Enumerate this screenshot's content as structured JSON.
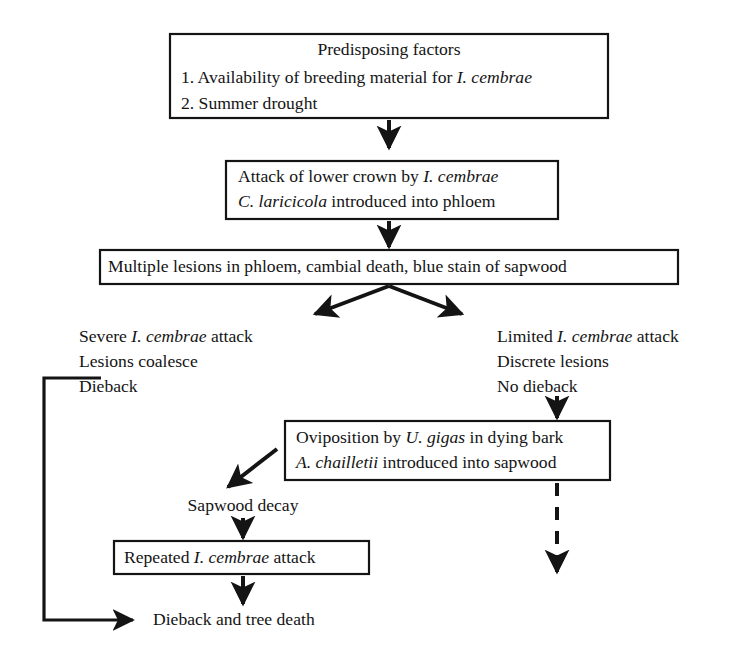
{
  "diagram": {
    "type": "flowchart",
    "colors": {
      "background": "#ffffff",
      "stroke": "#141414",
      "text": "#141414"
    },
    "nodes": [
      {
        "id": "predisposing-factors",
        "shape": "box",
        "lines": [
          {
            "segments": [
              {
                "text": "Predisposing factors",
                "italic": false
              }
            ],
            "align": "center"
          },
          {
            "segments": [
              {
                "text": "1. Availability of breeding material for ",
                "italic": false
              },
              {
                "text": "I. cembrae",
                "italic": true
              }
            ],
            "align": "left"
          },
          {
            "segments": [
              {
                "text": "2. Summer drought",
                "italic": false
              }
            ],
            "align": "left"
          }
        ]
      },
      {
        "id": "attack-lower-crown",
        "shape": "box",
        "lines": [
          {
            "segments": [
              {
                "text": "Attack of lower crown by ",
                "italic": false
              },
              {
                "text": "I. cembrae",
                "italic": true
              }
            ],
            "align": "left"
          },
          {
            "segments": [
              {
                "text": "C. laricicola",
                "italic": true
              },
              {
                "text": " introduced into phloem",
                "italic": false
              }
            ],
            "align": "left"
          }
        ]
      },
      {
        "id": "multiple-lesions",
        "shape": "box",
        "lines": [
          {
            "segments": [
              {
                "text": "Multiple lesions in phloem, cambial death, blue stain of sapwood",
                "italic": false
              }
            ],
            "align": "left"
          }
        ]
      },
      {
        "id": "severe-attack",
        "shape": "plain",
        "lines": [
          {
            "segments": [
              {
                "text": "Severe ",
                "italic": false
              },
              {
                "text": "I. cembrae",
                "italic": true
              },
              {
                "text": " attack",
                "italic": false
              }
            ],
            "align": "left"
          },
          {
            "segments": [
              {
                "text": "Lesions coalesce",
                "italic": false
              }
            ],
            "align": "left"
          },
          {
            "segments": [
              {
                "text": "Dieback",
                "italic": false
              }
            ],
            "align": "left"
          }
        ]
      },
      {
        "id": "limited-attack",
        "shape": "plain",
        "lines": [
          {
            "segments": [
              {
                "text": "Limited ",
                "italic": false
              },
              {
                "text": "I. cembrae",
                "italic": true
              },
              {
                "text": " attack",
                "italic": false
              }
            ],
            "align": "left"
          },
          {
            "segments": [
              {
                "text": "Discrete lesions",
                "italic": false
              }
            ],
            "align": "left"
          },
          {
            "segments": [
              {
                "text": "No dieback",
                "italic": false
              }
            ],
            "align": "left"
          }
        ]
      },
      {
        "id": "oviposition",
        "shape": "box",
        "lines": [
          {
            "segments": [
              {
                "text": "Oviposition by ",
                "italic": false
              },
              {
                "text": "U. gigas",
                "italic": true
              },
              {
                "text": " in dying bark",
                "italic": false
              }
            ],
            "align": "left"
          },
          {
            "segments": [
              {
                "text": "A. chailletii",
                "italic": true
              },
              {
                "text": " introduced into sapwood",
                "italic": false
              }
            ],
            "align": "left"
          }
        ]
      },
      {
        "id": "sapwood-decay",
        "shape": "plain",
        "lines": [
          {
            "segments": [
              {
                "text": "Sapwood decay",
                "italic": false
              }
            ],
            "align": "center"
          }
        ]
      },
      {
        "id": "repeated-attack",
        "shape": "box",
        "lines": [
          {
            "segments": [
              {
                "text": "Repeated ",
                "italic": false
              },
              {
                "text": "I. cembrae",
                "italic": true
              },
              {
                "text": " attack",
                "italic": false
              }
            ],
            "align": "left"
          }
        ]
      },
      {
        "id": "dieback-tree-death",
        "shape": "plain",
        "lines": [
          {
            "segments": [
              {
                "text": "Dieback and tree death",
                "italic": false
              }
            ],
            "align": "left"
          }
        ]
      }
    ],
    "edges": [
      {
        "id": "edge-factors-to-attack",
        "from": "predisposing-factors",
        "to": "attack-lower-crown",
        "style": "solid",
        "arrow": true
      },
      {
        "id": "edge-attack-to-lesions",
        "from": "attack-lower-crown",
        "to": "multiple-lesions",
        "style": "solid",
        "arrow": true
      },
      {
        "id": "edge-lesions-to-severe",
        "from": "multiple-lesions",
        "to": "severe-attack",
        "style": "solid",
        "arrow": true
      },
      {
        "id": "edge-lesions-to-limited",
        "from": "multiple-lesions",
        "to": "limited-attack",
        "style": "solid",
        "arrow": true
      },
      {
        "id": "edge-limited-to-oviposition",
        "from": "limited-attack",
        "to": "oviposition",
        "style": "solid",
        "arrow": true
      },
      {
        "id": "edge-oviposition-to-sapwood-decay",
        "from": "oviposition",
        "to": "sapwood-decay",
        "style": "solid",
        "arrow": true
      },
      {
        "id": "edge-sapwood-decay-to-repeated",
        "from": "sapwood-decay",
        "to": "repeated-attack",
        "style": "solid",
        "arrow": true
      },
      {
        "id": "edge-repeated-to-dieback",
        "from": "repeated-attack",
        "to": "dieback-tree-death",
        "style": "solid",
        "arrow": true
      },
      {
        "id": "edge-severe-to-dieback-loop",
        "from": "severe-attack",
        "to": "dieback-tree-death",
        "style": "solid",
        "arrow": true
      },
      {
        "id": "edge-oviposition-to-dieback-dashed",
        "from": "oviposition",
        "to": "dieback-tree-death",
        "style": "dashed",
        "arrow": true
      }
    ]
  },
  "text": {
    "n0_l0": "Predisposing factors",
    "n0_l1a": "1. Availability of breeding material for ",
    "n0_l1b": "I. cembrae",
    "n0_l2": "2. Summer drought",
    "n1_l0a": "Attack of lower crown by ",
    "n1_l0b": "I. cembrae",
    "n1_l1a": "C. laricicola",
    "n1_l1b": " introduced into phloem",
    "n2_l0": "Multiple lesions in phloem, cambial death, blue stain of sapwood",
    "n3_l0a": "Severe ",
    "n3_l0b": "I. cembrae",
    "n3_l0c": " attack",
    "n3_l1": "Lesions coalesce",
    "n3_l2": "Dieback",
    "n4_l0a": "Limited ",
    "n4_l0b": "I. cembrae",
    "n4_l0c": " attack",
    "n4_l1": "Discrete lesions",
    "n4_l2": "No dieback",
    "n5_l0a": "Oviposition by ",
    "n5_l0b": "U. gigas",
    "n5_l0c": " in dying bark",
    "n5_l1a": "A. chailletii",
    "n5_l1b": " introduced into sapwood",
    "n6_l0": "Sapwood decay",
    "n7_l0a": "Repeated ",
    "n7_l0b": "I. cembrae",
    "n7_l0c": " attack",
    "n8_l0": "Dieback and tree death"
  }
}
